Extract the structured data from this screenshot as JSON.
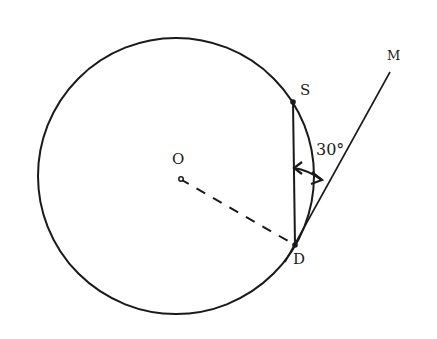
{
  "diagram": {
    "labels": {
      "center": "O",
      "point_s": "S",
      "point_d": "D",
      "point_m": "M",
      "angle": "30°"
    },
    "colors": {
      "stroke": "#1a1a1a",
      "background": "#ffffff"
    }
  }
}
